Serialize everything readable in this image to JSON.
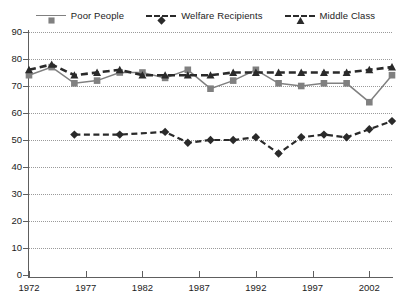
{
  "legend": {
    "position": "top-center",
    "items": [
      {
        "label": "Poor People",
        "marker": "square-marker-icon",
        "color": "#808080",
        "dash": "solid"
      },
      {
        "label": "Welfare Recipients",
        "marker": "diamond-marker-icon",
        "color": "#2a2a2a",
        "dash": "dashed"
      },
      {
        "label": "Middle Class",
        "marker": "triangle-marker-icon",
        "color": "#2a2a2a",
        "dash": "dashed"
      }
    ]
  },
  "axes": {
    "y_ticks": [
      0,
      10,
      20,
      30,
      40,
      50,
      60,
      70,
      80,
      90
    ],
    "x_ticks": [
      1972,
      1977,
      1982,
      1987,
      1992,
      1997,
      2002
    ]
  },
  "chart_data": {
    "type": "line",
    "title": "",
    "subtitle": "",
    "xlabel": "",
    "ylabel": "",
    "xlim": [
      1972,
      2004
    ],
    "ylim": [
      0,
      90
    ],
    "grid": true,
    "legend_position": "top-center",
    "x": [
      1972,
      1973,
      1974,
      1975,
      1976,
      1977,
      1978,
      1979,
      1980,
      1981,
      1982,
      1983,
      1984,
      1985,
      1986,
      1987,
      1988,
      1989,
      1990,
      1991,
      1992,
      1993,
      1994,
      1995,
      1996,
      1997,
      1998,
      1999,
      2000,
      2001,
      2002,
      2003,
      2004
    ],
    "series": [
      {
        "name": "Poor People",
        "color": "#808080",
        "marker": "square",
        "dash": "solid",
        "x": [
          1972,
          1974,
          1976,
          1978,
          1980,
          1982,
          1984,
          1986,
          1988,
          1990,
          1992,
          1994,
          1996,
          1998,
          2000,
          2002,
          2004
        ],
        "values": [
          74,
          77,
          71,
          72,
          75,
          75,
          73,
          76,
          69,
          72,
          76,
          71,
          70,
          71,
          71,
          64,
          74
        ]
      },
      {
        "name": "Welfare Recipients",
        "color": "#2a2a2a",
        "marker": "diamond",
        "dash": "dashed",
        "x": [
          1976,
          1980,
          1984,
          1986,
          1988,
          1990,
          1992,
          1994,
          1996,
          1998,
          2000,
          2002,
          2004
        ],
        "values": [
          52,
          52,
          53,
          49,
          50,
          50,
          51,
          45,
          51,
          52,
          51,
          54,
          57
        ]
      },
      {
        "name": "Middle Class",
        "color": "#2a2a2a",
        "marker": "triangle",
        "dash": "dashed",
        "x": [
          1972,
          1974,
          1976,
          1978,
          1980,
          1982,
          1984,
          1986,
          1988,
          1990,
          1992,
          1994,
          1996,
          1998,
          2000,
          2002,
          2004
        ],
        "values": [
          76,
          78,
          74,
          75,
          76,
          74,
          74,
          74,
          74,
          75,
          75,
          75,
          75,
          75,
          75,
          76,
          77
        ]
      }
    ]
  }
}
